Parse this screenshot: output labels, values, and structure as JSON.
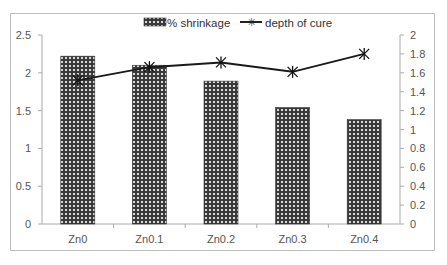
{
  "chart_data": {
    "type": "bar+line",
    "title": "",
    "categories": [
      "Zn0",
      "Zn0.1",
      "Zn0.2",
      "Zn0.3",
      "Zn0.4"
    ],
    "series": [
      {
        "name": "% shrinkage",
        "type": "bar",
        "axis": "left",
        "values": [
          2.22,
          2.1,
          1.89,
          1.54,
          1.38
        ]
      },
      {
        "name": "depth of cure",
        "type": "line",
        "axis": "right",
        "marker": "asterisk",
        "values": [
          1.52,
          1.66,
          1.71,
          1.61,
          1.8
        ]
      }
    ],
    "left_axis": {
      "range": [
        0,
        2.5
      ],
      "ticks": [
        "0",
        "0.5",
        "1",
        "1.5",
        "2",
        "2.5"
      ]
    },
    "right_axis": {
      "range": [
        0,
        2
      ],
      "ticks": [
        "0",
        "0.2",
        "0.4",
        "0.6",
        "0.8",
        "1",
        "1.2",
        "1.4",
        "1.6",
        "1.8",
        "2"
      ]
    },
    "legend": {
      "position": "top",
      "entries": [
        "% shrinkage",
        "depth of cure"
      ]
    },
    "grid": false,
    "xlabel": "",
    "ylabel": "",
    "y2label": ""
  }
}
